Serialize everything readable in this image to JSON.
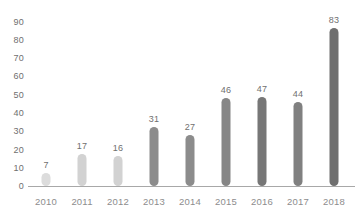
{
  "chart_data": {
    "type": "bar",
    "title": "",
    "subtitle": "",
    "xlabel": "",
    "ylabel": "",
    "categories": [
      "2010",
      "2011",
      "2012",
      "2013",
      "2014",
      "2015",
      "2016",
      "2017",
      "2018"
    ],
    "values": [
      7,
      17,
      16,
      31,
      27,
      46,
      47,
      44,
      83
    ],
    "value_labels": [
      "7",
      "17",
      "16",
      "31",
      "27",
      "46",
      "47",
      "44",
      "83"
    ],
    "bar_colors": [
      "#dcdcdc",
      "#d2d2d2",
      "#d2d2d2",
      "#8c8c8c",
      "#8c8c8c",
      "#868686",
      "#777777",
      "#808080",
      "#6f6f6f"
    ],
    "ylim": [
      0,
      90
    ],
    "yticks": [
      0,
      10,
      20,
      30,
      40,
      50,
      60,
      70,
      80,
      90
    ],
    "ytick_labels": [
      "0",
      "10",
      "20",
      "30",
      "40",
      "50",
      "60",
      "70",
      "80",
      "90"
    ],
    "grid": false,
    "legend": null,
    "axis_line_color": "#a8a8a8",
    "tick_label_color": "#8d8d8d",
    "value_label_color": "#6f6f6f"
  }
}
